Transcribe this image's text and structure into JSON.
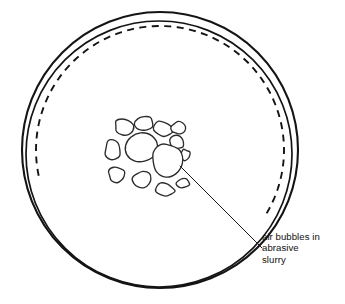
{
  "diagram": {
    "type": "technical-line-drawing",
    "canvas": {
      "width": 345,
      "height": 304,
      "background": "#ffffff"
    },
    "colors": {
      "line": "#141414",
      "bubble_stroke": "#2b2b2b",
      "bubble_fill": "#ffffff",
      "leader": "#1a1a1a",
      "text": "#111111"
    }
  },
  "plate": {
    "label": "circular lapping plate",
    "outer_rim": {
      "name": "outer-rim-arc",
      "cx": 160,
      "cy": 150,
      "rx": 138,
      "ry": 138,
      "stroke_width": 2.1
    },
    "inner_rim": {
      "name": "inner-rim-arc",
      "cx": 159,
      "cy": 154,
      "rx": 133,
      "ry": 133,
      "stroke_width": 1.7
    },
    "dashed_arc": {
      "name": "dashed-inner-arc",
      "cx": 160,
      "cy": 150,
      "rx": 124,
      "ry": 124,
      "start_angle_deg": 168,
      "end_angle_deg": 32,
      "dash_pattern": "7 5.5",
      "stroke_width": 1.9
    }
  },
  "bubbles": {
    "name": "air-bubble-cluster",
    "count": 13,
    "center": {
      "x": 148,
      "y": 150
    },
    "items": [
      {
        "id": "bubble-core",
        "cx": 140,
        "cy": 148,
        "rx": 17.5,
        "ry": 16.0,
        "rot": -8
      },
      {
        "id": "bubble-n1",
        "cx": 124,
        "cy": 127,
        "rx": 9.5,
        "ry": 7.5,
        "rot": 22
      },
      {
        "id": "bubble-n2",
        "cx": 144,
        "cy": 124,
        "rx": 9.0,
        "ry": 7.0,
        "rot": -14
      },
      {
        "id": "bubble-n3",
        "cx": 163,
        "cy": 129,
        "rx": 9.8,
        "ry": 7.2,
        "rot": 8
      },
      {
        "id": "bubble-e1",
        "cx": 177,
        "cy": 142,
        "rx": 7.5,
        "ry": 7.0,
        "rot": 0
      },
      {
        "id": "bubble-e2",
        "cx": 185,
        "cy": 155,
        "rx": 5.0,
        "ry": 5.5,
        "rot": 12
      },
      {
        "id": "bubble-w1",
        "cx": 113,
        "cy": 150,
        "rx": 8.0,
        "ry": 11.0,
        "rot": -6
      },
      {
        "id": "bubble-w2",
        "cx": 117,
        "cy": 175,
        "rx": 8.5,
        "ry": 7.5,
        "rot": 10
      },
      {
        "id": "bubble-s1",
        "cx": 142,
        "cy": 180,
        "rx": 10.0,
        "ry": 8.5,
        "rot": -5
      },
      {
        "id": "bubble-s2",
        "cx": 165,
        "cy": 190,
        "rx": 9.0,
        "ry": 6.8,
        "rot": 6
      },
      {
        "id": "bubble-s3",
        "cx": 183,
        "cy": 183,
        "rx": 6.5,
        "ry": 5.0,
        "rot": -18
      },
      {
        "id": "bubble-big-se",
        "cx": 166,
        "cy": 160,
        "rx": 15.0,
        "ry": 17.0,
        "rot": 10
      },
      {
        "id": "bubble-ne",
        "cx": 178,
        "cy": 128,
        "rx": 7.0,
        "ry": 6.2,
        "rot": -10
      }
    ]
  },
  "leader_line": {
    "name": "annotation-leader-line",
    "from": {
      "x": 180,
      "y": 166
    },
    "to": {
      "x": 262,
      "y": 248
    }
  },
  "annotation": {
    "name": "bubble-annotation",
    "text": "air bubbles in abrasive slurry",
    "lines": [
      "air bubbles in",
      "abrasive",
      "slurry"
    ],
    "position": {
      "x": 262,
      "y": 231
    },
    "font_size_px": 9.6
  }
}
